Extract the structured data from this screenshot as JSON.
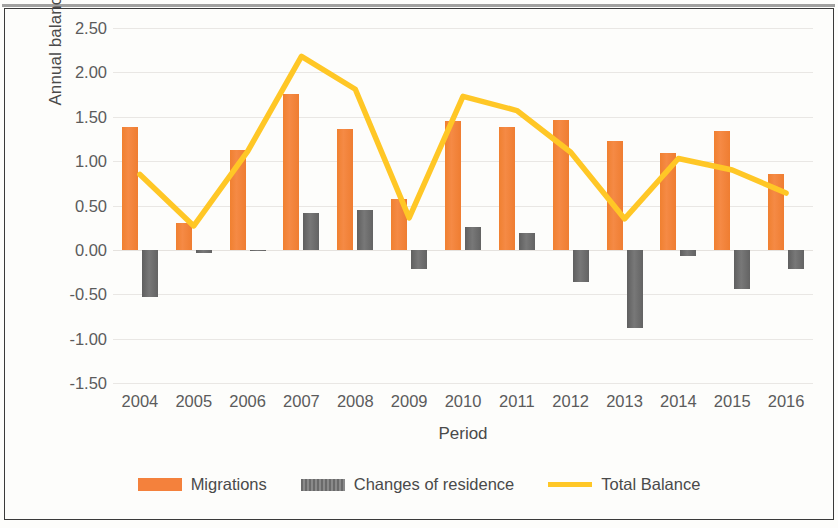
{
  "chart_data": {
    "type": "bar",
    "title": "",
    "xlabel": "Period",
    "ylabel": "Annual balance (%)",
    "categories": [
      "2004",
      "2005",
      "2006",
      "2007",
      "2008",
      "2009",
      "2010",
      "2011",
      "2012",
      "2013",
      "2014",
      "2015",
      "2016"
    ],
    "ylim": [
      -1.5,
      2.5
    ],
    "ytick_labels": [
      "2.50",
      "2.00",
      "1.50",
      "1.00",
      "0.50",
      "0.00",
      "-0.50",
      "-1.00",
      "-1.50"
    ],
    "yticks": [
      2.5,
      2.0,
      1.5,
      1.0,
      0.5,
      0.0,
      -0.5,
      -1.0,
      -1.5
    ],
    "grid": true,
    "legend_position": "bottom",
    "series": [
      {
        "name": "Migrations",
        "type": "bar",
        "color": "#F4813C",
        "values": [
          1.38,
          0.3,
          1.12,
          1.76,
          1.36,
          0.57,
          1.45,
          1.38,
          1.46,
          1.23,
          1.09,
          1.34,
          0.86
        ]
      },
      {
        "name": "Changes of residence",
        "type": "bar",
        "color": "#6D6D6D",
        "values": [
          -0.53,
          -0.04,
          -0.01,
          0.41,
          0.45,
          -0.21,
          0.26,
          0.19,
          -0.36,
          -0.88,
          -0.07,
          -0.44,
          -0.22
        ]
      },
      {
        "name": "Total Balance",
        "type": "line",
        "color": "#FFC726",
        "values": [
          0.85,
          0.27,
          1.11,
          2.18,
          1.81,
          0.36,
          1.73,
          1.57,
          1.1,
          0.35,
          1.03,
          0.9,
          0.64
        ]
      }
    ]
  },
  "legend": {
    "items": [
      {
        "label": "Migrations",
        "swatch": "bar-orange"
      },
      {
        "label": "Changes of residence",
        "swatch": "bar-gray"
      },
      {
        "label": "Total Balance",
        "swatch": "line-yellow"
      }
    ]
  }
}
